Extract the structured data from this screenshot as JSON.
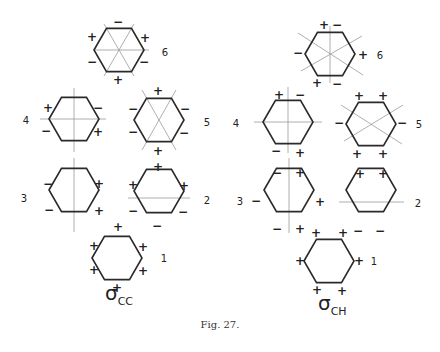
{
  "figure": {
    "caption": "Fig. 27.",
    "panels": [
      {
        "id": "cc",
        "label_symbol": "σ",
        "label_sub": "CC",
        "label_pos": [
          105,
          300
        ],
        "radius": 25,
        "hexagons": [
          {
            "n": "6",
            "cx": 119,
            "cy": 50,
            "num_pos": [
              165,
              52
            ],
            "axes": [
              [
                94,
                50,
                149,
                50
              ],
              [
                104,
                24,
                134,
                76
              ],
              [
                134,
                24,
                104,
                76
              ]
            ],
            "signs": [
              [
                "−",
                118,
                22
              ],
              [
                "+",
                92,
                37
              ],
              [
                "+",
                145,
                38
              ],
              [
                "−",
                92,
                62
              ],
              [
                "−",
                144,
                62
              ],
              [
                "+",
                118,
                80
              ]
            ]
          },
          {
            "n": "4",
            "cx": 74,
            "cy": 119,
            "num_pos": [
              26,
              120
            ],
            "axes": [
              [
                40,
                119,
                106,
                119
              ],
              [
                74,
                88,
                74,
                152
              ]
            ],
            "signs": [
              [
                "+",
                48,
                108
              ],
              [
                "−",
                98,
                108
              ],
              [
                "−",
                46,
                131
              ],
              [
                "+",
                98,
                132
              ]
            ]
          },
          {
            "n": "5",
            "cx": 159,
            "cy": 120,
            "num_pos": [
              207,
              122
            ],
            "axes": [
              [
                142,
                90,
                176,
                150
              ],
              [
                176,
                90,
                142,
                150
              ]
            ],
            "signs": [
              [
                "+",
                158,
                91
              ],
              [
                "−",
                133,
                109
              ],
              [
                "−",
                185,
                109
              ],
              [
                "−",
                133,
                132
              ],
              [
                "−",
                184,
                133
              ],
              [
                "+",
                158,
                151
              ]
            ]
          },
          {
            "n": "3",
            "cx": 74,
            "cy": 190,
            "num_pos": [
              24,
              198
            ],
            "axes": [
              [
                74,
                158,
                74,
                232
              ]
            ],
            "signs": [
              [
                "−",
                48,
                184
              ],
              [
                "+",
                99,
                184
              ],
              [
                "−",
                49,
                210
              ],
              [
                "+",
                99,
                211
              ]
            ]
          },
          {
            "n": "2",
            "cx": 159,
            "cy": 191,
            "num_pos": [
              207,
              200
            ],
            "axes": [
              [
                128,
                198,
                190,
                198
              ]
            ],
            "signs": [
              [
                "+",
                158,
                167
              ],
              [
                "+",
                133,
                185
              ],
              [
                "+",
                184,
                186
              ],
              [
                "−",
                133,
                211
              ],
              [
                "−",
                183,
                212
              ],
              [
                "−",
                157,
                226
              ]
            ]
          },
          {
            "n": "1",
            "cx": 117,
            "cy": 258,
            "num_pos": [
              164,
              258
            ],
            "axes": [],
            "signs": [
              [
                "+",
                118,
                227
              ],
              [
                "+",
                94,
                246
              ],
              [
                "+",
                143,
                247
              ],
              [
                "+",
                94,
                270
              ],
              [
                "+",
                143,
                271
              ],
              [
                "+",
                117,
                288
              ]
            ]
          }
        ]
      },
      {
        "id": "ch",
        "label_symbol": "σ",
        "label_sub": "CH",
        "label_pos": [
          318,
          310
        ],
        "radius": 25,
        "hexagons": [
          {
            "n": "6",
            "cx": 330,
            "cy": 54,
            "num_pos": [
              380,
              55
            ],
            "axes": [
              [
                330,
                26,
                330,
                83
              ],
              [
                298,
                33,
                363,
                75
              ],
              [
                301,
                71,
                362,
                36
              ]
            ],
            "signs": [
              [
                "+",
                324,
                25
              ],
              [
                "−",
                337,
                25
              ],
              [
                "−",
                298,
                53
              ],
              [
                "+",
                363,
                55
              ],
              [
                "+",
                317,
                83
              ],
              [
                "−",
                337,
                84
              ]
            ]
          },
          {
            "n": "4",
            "cx": 288,
            "cy": 122,
            "num_pos": [
              236,
              123
            ],
            "axes": [
              [
                254,
                122,
                322,
                122
              ],
              [
                288,
                87,
                288,
                153
              ]
            ],
            "signs": [
              [
                "+",
                279,
                95
              ],
              [
                "−",
                300,
                95
              ],
              [
                "−",
                276,
                151
              ],
              [
                "+",
                300,
                153
              ]
            ]
          },
          {
            "n": "5",
            "cx": 371,
            "cy": 124,
            "num_pos": [
              419,
              124
            ],
            "axes": [
              [
                341,
                105,
                402,
                144
              ],
              [
                344,
                141,
                403,
                105
              ]
            ],
            "signs": [
              [
                "+",
                359,
                96
              ],
              [
                "+",
                383,
                96
              ],
              [
                "−",
                339,
                123
              ],
              [
                "−",
                402,
                123
              ],
              [
                "+",
                357,
                154
              ],
              [
                "+",
                383,
                154
              ]
            ]
          },
          {
            "n": "3",
            "cx": 289,
            "cy": 190,
            "num_pos": [
              240,
              201
            ],
            "axes": [
              [
                289,
                158,
                289,
                233
              ]
            ],
            "signs": [
              [
                "−",
                277,
                173
              ],
              [
                "+",
                300,
                173
              ],
              [
                "−",
                256,
                201
              ],
              [
                "+",
                320,
                202
              ],
              [
                "−",
                277,
                229
              ],
              [
                "+",
                300,
                229
              ]
            ]
          },
          {
            "n": "2",
            "cx": 371,
            "cy": 190,
            "num_pos": [
              418,
              203
            ],
            "axes": [
              [
                339,
                202,
                404,
                202
              ]
            ],
            "signs": [
              [
                "+",
                360,
                174
              ],
              [
                "+",
                383,
                174
              ],
              [
                "−",
                358,
                231
              ],
              [
                "−",
                380,
                231
              ]
            ]
          },
          {
            "n": "1",
            "cx": 329,
            "cy": 261,
            "num_pos": [
              374,
              261
            ],
            "axes": [],
            "signs": [
              [
                "+",
                316,
                233
              ],
              [
                "+",
                343,
                233
              ],
              [
                "+",
                300,
                261
              ],
              [
                "+",
                359,
                261
              ],
              [
                "+",
                317,
                290
              ],
              [
                "+",
                342,
                291
              ]
            ]
          }
        ]
      }
    ]
  }
}
